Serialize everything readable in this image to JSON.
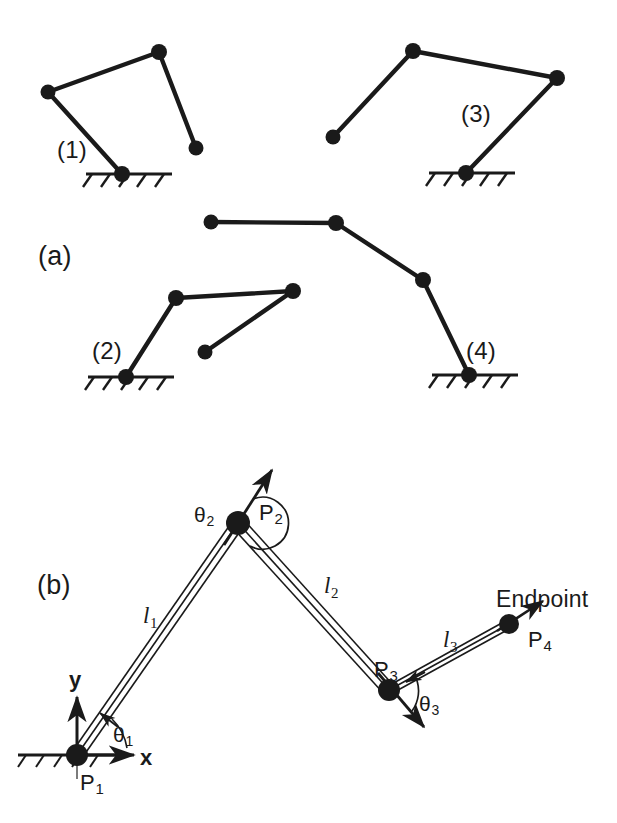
{
  "figure": {
    "stroke_color": "#1a1a1a",
    "background_color": "#ffffff",
    "panels": [
      {
        "id": "a",
        "label": "(a)",
        "x": 38,
        "y": 241
      },
      {
        "id": "b",
        "label": "(b)",
        "x": 37,
        "y": 570
      }
    ]
  },
  "panel_a": {
    "caption": "(a)",
    "description": "Four postures of a three-link serial chain anchored to ground",
    "configurations": [
      {
        "label": "(1)",
        "label_x": 57,
        "label_y": 136,
        "ground": {
          "x": 86,
          "y": 174,
          "width": 86,
          "hatch_count": 5
        },
        "joints": [
          {
            "name": "P1",
            "x": 122,
            "y": 174,
            "r": 8,
            "grounded": true
          },
          {
            "name": "P2",
            "x": 48,
            "y": 92,
            "r": 7,
            "grounded": false
          },
          {
            "name": "P3",
            "x": 159,
            "y": 52,
            "r": 8,
            "grounded": false
          },
          {
            "name": "P4",
            "x": 196,
            "y": 148,
            "r": 7,
            "grounded": false
          }
        ]
      },
      {
        "label": "(3)",
        "label_x": 461,
        "label_y": 100,
        "ground": {
          "x": 429,
          "y": 173,
          "width": 86,
          "hatch_count": 5
        },
        "joints": [
          {
            "name": "P1",
            "x": 466,
            "y": 173,
            "r": 8,
            "grounded": true
          },
          {
            "name": "P2",
            "x": 557,
            "y": 78,
            "r": 8,
            "grounded": false
          },
          {
            "name": "P3",
            "x": 413,
            "y": 51,
            "r": 8,
            "grounded": false
          },
          {
            "name": "P4",
            "x": 333,
            "y": 137,
            "r": 7,
            "grounded": false
          }
        ]
      },
      {
        "label": "(2)",
        "label_x": 92,
        "label_y": 337,
        "ground": {
          "x": 88,
          "y": 377,
          "width": 86,
          "hatch_count": 5
        },
        "joints": [
          {
            "name": "P1",
            "x": 126,
            "y": 377,
            "r": 8,
            "grounded": true
          },
          {
            "name": "P2",
            "x": 176,
            "y": 298,
            "r": 8,
            "grounded": false
          },
          {
            "name": "P3",
            "x": 293,
            "y": 291,
            "r": 8,
            "grounded": false
          },
          {
            "name": "P4",
            "x": 205,
            "y": 352,
            "r": 7,
            "grounded": false
          }
        ]
      },
      {
        "label": "(4)",
        "label_x": 466,
        "label_y": 337,
        "ground": {
          "x": 432,
          "y": 375,
          "width": 86,
          "hatch_count": 5
        },
        "joints": [
          {
            "name": "P1",
            "x": 469,
            "y": 375,
            "r": 8,
            "grounded": true
          },
          {
            "name": "P2",
            "x": 423,
            "y": 280,
            "r": 8,
            "grounded": false
          },
          {
            "name": "P3",
            "x": 336,
            "y": 223,
            "r": 8,
            "grounded": false
          },
          {
            "name": "P4",
            "x": 211,
            "y": 222,
            "r": 7,
            "grounded": false
          }
        ]
      }
    ]
  },
  "panel_b": {
    "caption": "(b)",
    "description": "Three-link planar manipulator with joint angles, link lengths and endpoint",
    "ground": {
      "x": 18,
      "y": 755,
      "width": 112,
      "hatch_count": 5
    },
    "joints": [
      {
        "name": "P1",
        "x": 77,
        "y": 755,
        "r": 11,
        "grounded": true
      },
      {
        "name": "P2",
        "x": 238,
        "y": 523,
        "r": 12,
        "grounded": false
      },
      {
        "name": "P3",
        "x": 389,
        "y": 690,
        "r": 11,
        "grounded": false
      },
      {
        "name": "P4",
        "x": 509,
        "y": 624,
        "r": 10,
        "grounded": false
      }
    ],
    "joint_labels": [
      {
        "text": "P",
        "sub": "1",
        "x": 80,
        "y": 770
      },
      {
        "text": "P",
        "sub": "2",
        "x": 259,
        "y": 500
      },
      {
        "text": "P",
        "sub": "3",
        "x": 374,
        "y": 657
      },
      {
        "text": "P",
        "sub": "4",
        "x": 528,
        "y": 627
      }
    ],
    "link_length_labels": [
      {
        "text": "l",
        "sub": "1",
        "x": 143,
        "y": 603
      },
      {
        "text": "l",
        "sub": "2",
        "x": 324,
        "y": 573
      },
      {
        "text": "l",
        "sub": "3",
        "x": 443,
        "y": 627
      }
    ],
    "angle_labels": [
      {
        "text": "θ",
        "sub": "1",
        "x": 113,
        "y": 723
      },
      {
        "text": "θ",
        "sub": "2",
        "x": 194,
        "y": 503
      },
      {
        "text": "θ",
        "sub": "3",
        "x": 419,
        "y": 692
      }
    ],
    "axes": {
      "origin": {
        "x": 77,
        "y": 755
      },
      "x_axis": {
        "label": "x",
        "tip_x": 133,
        "tip_y": 755,
        "label_x": 140,
        "label_y": 745
      },
      "y_axis": {
        "label": "y",
        "tip_x": 77,
        "tip_y": 698,
        "label_x": 69,
        "label_y": 667
      }
    },
    "endpoint": {
      "label": "Endpoint",
      "x": 496,
      "y": 586,
      "arrow_tip": {
        "x": 541,
        "y": 602
      }
    },
    "joint_axis_arrows": [
      {
        "joint": "P2",
        "tip_x": 273,
        "tip_y": 469
      },
      {
        "joint": "P3",
        "tip_x": 423,
        "tip_y": 726
      }
    ]
  }
}
